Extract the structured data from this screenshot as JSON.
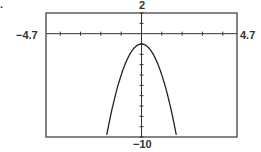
{
  "figure_label": "5.",
  "window": {
    "xmin_label": "−4.7",
    "xmax_label": "4.7",
    "ymax_label": "2",
    "ymin_label": "−10"
  },
  "chart_data": {
    "type": "line",
    "title": "",
    "xlabel": "",
    "ylabel": "",
    "xlim": [
      -4.7,
      4.7
    ],
    "ylim": [
      -10,
      2
    ],
    "x_tick_step": 1,
    "y_tick_step": 1,
    "grid": false,
    "legend": null,
    "series": [
      {
        "name": "y = -3x^2 - 1",
        "x": [
          -1.73,
          -1.5,
          -1.25,
          -1.0,
          -0.75,
          -0.5,
          -0.25,
          0,
          0.25,
          0.5,
          0.75,
          1.0,
          1.25,
          1.5,
          1.73
        ],
        "y": [
          -10,
          -7.75,
          -5.69,
          -4,
          -2.69,
          -1.75,
          -1.19,
          -1,
          -1.19,
          -1.75,
          -2.69,
          -4,
          -5.69,
          -7.75,
          -10
        ]
      }
    ],
    "vertex": [
      0,
      -1
    ]
  }
}
